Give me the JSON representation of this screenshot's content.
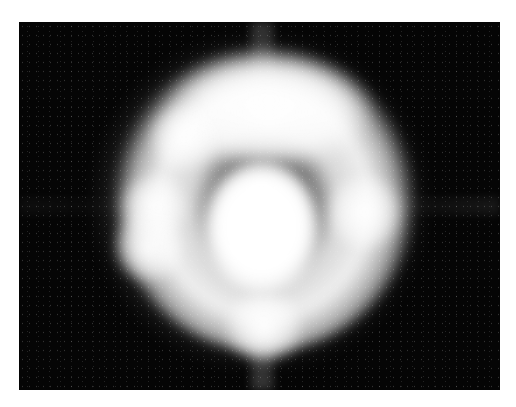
{
  "image": {
    "subject": "glowing white ring-shaped halo with bright central core on black background",
    "colors": {
      "background": "#050505",
      "glow": "#ffffff",
      "page": "#ffffff"
    }
  }
}
